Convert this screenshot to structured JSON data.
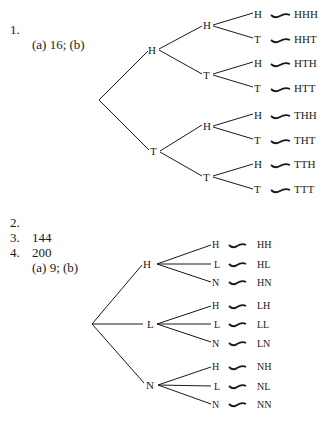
{
  "answers": [
    {
      "number": "1.",
      "text": "(a) 16; (b)"
    },
    {
      "number": "2.",
      "text": "144"
    },
    {
      "number": "3.",
      "text": "200"
    },
    {
      "number": "4.",
      "text": "(a) 9; (b)"
    }
  ],
  "tree1": {
    "level1": [
      "H",
      "T"
    ],
    "level2": [
      "H",
      "T",
      "H",
      "T"
    ],
    "leaves": [
      "H",
      "T",
      "H",
      "T",
      "H",
      "T",
      "H",
      "T"
    ],
    "outcomes": [
      "HHH",
      "HHT",
      "HTH",
      "HTT",
      "THH",
      "THT",
      "TTH",
      "TTT"
    ]
  },
  "tree2": {
    "level1": [
      "H",
      "L",
      "N"
    ],
    "leaves": [
      "H",
      "L",
      "N",
      "H",
      "L",
      "N",
      "H",
      "L",
      "N"
    ],
    "outcomes": [
      "HH",
      "HL",
      "HN",
      "LH",
      "LL",
      "LN",
      "NH",
      "NL",
      "NN"
    ]
  }
}
